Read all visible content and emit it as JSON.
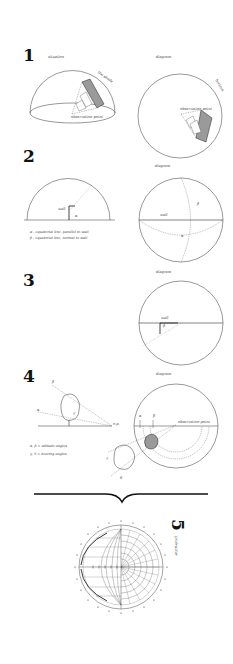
{
  "sections": [
    {
      "number": "1",
      "left": {
        "label": "situation",
        "annotations": [
          "the shade",
          "observation point"
        ]
      },
      "right": {
        "label": "diagram",
        "annotations": [
          "horizon",
          "observation point"
        ]
      }
    },
    {
      "number": "2",
      "left": {
        "annotations": [
          "wall",
          "α"
        ]
      },
      "right": {
        "label": "diagram",
        "annotations": [
          "wall",
          "β",
          "α"
        ]
      },
      "notes": [
        "α - equatorial line, parallel to wall",
        "β - equatorial line, normal to wall"
      ]
    },
    {
      "number": "3",
      "right": {
        "label": "diagram",
        "annotations": [
          "wall",
          "β"
        ]
      }
    },
    {
      "number": "4",
      "left": {
        "annotations": [
          "β",
          "α",
          "γ",
          "o.p."
        ]
      },
      "right": {
        "label": "diagram",
        "annotations": [
          "α",
          "β",
          "observation point",
          "γ",
          "δ"
        ]
      },
      "notes": [
        "α, β = altitude angles",
        "γ, δ = bearing angles"
      ]
    },
    {
      "number": "5",
      "caption": "protractor"
    }
  ],
  "colors": {
    "ink": "#222222",
    "shade": "#9a9a9a",
    "background": "#ffffff"
  }
}
